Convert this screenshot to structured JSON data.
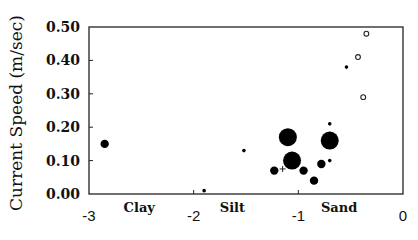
{
  "chart_data": {
    "type": "scatter",
    "title": "",
    "xlabel": "",
    "ylabel": "Current Speed (m/sec)",
    "xlim": [
      -3,
      0
    ],
    "ylim": [
      0,
      0.5
    ],
    "xticks": [
      -3,
      -2,
      -1,
      0
    ],
    "xtick_labels": [
      "-3",
      "-2",
      "-1",
      "0"
    ],
    "yticks": [
      0,
      0.1,
      0.2,
      0.3,
      0.4,
      0.5
    ],
    "ytick_labels": [
      "0.00",
      "0.10",
      "0.20",
      "0.30",
      "0.40",
      "0.50"
    ],
    "category_labels": [
      {
        "text": "Clay",
        "x": -2.52
      },
      {
        "text": "Silt",
        "x": -1.63
      },
      {
        "text": "Sand",
        "x": -0.61
      }
    ],
    "grid": false,
    "legend": null,
    "marker_sizes": {
      "small": "small",
      "medium": "medium",
      "large": "large"
    },
    "series": [
      {
        "name": "filled",
        "marker": "filled-circle",
        "points": [
          {
            "x": -2.85,
            "y": 0.15,
            "size": "medium"
          },
          {
            "x": -1.9,
            "y": 0.01,
            "size": "small"
          },
          {
            "x": -1.52,
            "y": 0.13,
            "size": "small"
          },
          {
            "x": -1.23,
            "y": 0.07,
            "size": "medium"
          },
          {
            "x": -1.1,
            "y": 0.17,
            "size": "large"
          },
          {
            "x": -1.06,
            "y": 0.1,
            "size": "large"
          },
          {
            "x": -0.95,
            "y": 0.07,
            "size": "medium"
          },
          {
            "x": -0.85,
            "y": 0.04,
            "size": "medium"
          },
          {
            "x": -0.78,
            "y": 0.09,
            "size": "medium"
          },
          {
            "x": -0.7,
            "y": 0.1,
            "size": "small"
          },
          {
            "x": -0.7,
            "y": 0.21,
            "size": "small"
          },
          {
            "x": -0.7,
            "y": 0.16,
            "size": "large"
          },
          {
            "x": -0.54,
            "y": 0.38,
            "size": "small"
          }
        ]
      },
      {
        "name": "open",
        "marker": "open-circle",
        "points": [
          {
            "x": -0.35,
            "y": 0.48,
            "size": "medium"
          },
          {
            "x": -0.43,
            "y": 0.41,
            "size": "medium"
          },
          {
            "x": -0.38,
            "y": 0.29,
            "size": "medium"
          }
        ]
      },
      {
        "name": "plus",
        "marker": "plus",
        "points": [
          {
            "x": -1.15,
            "y": 0.075,
            "size": "small"
          }
        ]
      }
    ]
  }
}
